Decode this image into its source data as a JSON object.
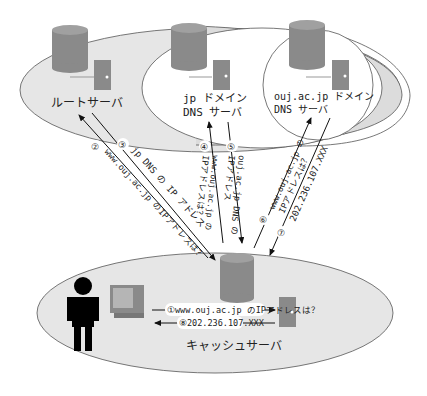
{
  "diagram": {
    "servers": {
      "root": {
        "label": "ルートサーバ"
      },
      "jp": {
        "label_line1": "jp ドメイン",
        "label_line2": "DNS サーバ"
      },
      "ouj": {
        "label_line1": "ouj.ac.jp ドメイン",
        "label_line2": "DNS サーバ"
      },
      "cache": {
        "label": "キャッシュサーバ"
      }
    },
    "steps": {
      "s1": "①www.ouj.ac.jp のIPアドレスは？",
      "s2_num": "②",
      "s2": "www.ouj.ac.jp のIPアドレスは？",
      "s3_num": "③",
      "s3": "jp DNS の IP アドレス",
      "s4_num": "④",
      "s4_line1": "www.ouj.ac.jp の",
      "s4_line2": "IPアドレスは？",
      "s5_num": "⑤",
      "s5_line1": "ouj.ac.jp DNS の",
      "s5_line2": "IPアドレス",
      "s6_num": "⑥",
      "s6_line1": "www.ouj.ac.jp の",
      "s6_line2": "IPアドレスは？",
      "s7_num": "⑦",
      "s7": "202.236.107.XXX",
      "s8": "⑧202.236.107.XXX"
    },
    "colors": {
      "ellipse_fill": "#e6e6e6",
      "server_fill": "#8a8a8a",
      "person": "#000000"
    }
  }
}
